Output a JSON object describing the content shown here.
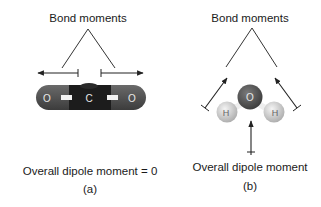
{
  "panel_a": {
    "header": "Bond moments",
    "caption": "Overall dipole moment = 0",
    "sublabel": "(a)",
    "molecule": {
      "name": "carbon dioxide",
      "atoms": [
        "O",
        "C",
        "O"
      ]
    }
  },
  "panel_b": {
    "header": "Bond moments",
    "caption": "Overall dipole moment",
    "sublabel": "(b)",
    "molecule": {
      "name": "water",
      "atoms": [
        "H",
        "O",
        "H"
      ]
    }
  },
  "colors": {
    "text": "#1a1a1a",
    "line": "#333333",
    "oxygen": "#5a5a5a",
    "carbon": "#1e1e1e",
    "hydrogen": "#d6d6d6",
    "bond": "#f2f2f2"
  }
}
